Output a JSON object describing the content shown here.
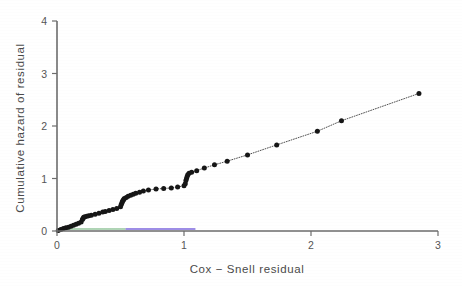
{
  "chart_data": {
    "type": "scatter",
    "title": "",
    "xlabel": "Cox − Snell residual",
    "ylabel": "Cumulative hazard of residual",
    "xlim": [
      0,
      3
    ],
    "ylim": [
      0,
      4
    ],
    "xticks": [
      0,
      1,
      2,
      3
    ],
    "xtick_labels": [
      "0",
      "1",
      "2",
      "3"
    ],
    "yticks": [
      0,
      1,
      2,
      3,
      4
    ],
    "ytick_labels": [
      "0",
      "1",
      "2",
      "3",
      "4"
    ],
    "grid": false,
    "legend": "none",
    "marker": "filled-circle",
    "line_style": "dotted",
    "series": [
      {
        "name": "Cumulative hazard of Cox-Snell residual",
        "x": [
          0.01,
          0.03,
          0.05,
          0.07,
          0.09,
          0.11,
          0.13,
          0.15,
          0.17,
          0.19,
          0.2,
          0.205,
          0.21,
          0.22,
          0.235,
          0.25,
          0.27,
          0.3,
          0.33,
          0.36,
          0.38,
          0.41,
          0.44,
          0.47,
          0.5,
          0.505,
          0.51,
          0.515,
          0.52,
          0.525,
          0.53,
          0.545,
          0.56,
          0.58,
          0.6,
          0.62,
          0.65,
          0.68,
          0.72,
          0.78,
          0.84,
          0.9,
          0.95,
          1.0,
          1.01,
          1.015,
          1.02,
          1.025,
          1.03,
          1.04,
          1.06,
          1.1,
          1.16,
          1.24,
          1.34,
          1.5,
          1.73,
          2.05,
          2.24,
          2.85
        ],
        "y": [
          0.01,
          0.03,
          0.05,
          0.06,
          0.07,
          0.09,
          0.11,
          0.13,
          0.15,
          0.17,
          0.22,
          0.24,
          0.26,
          0.27,
          0.28,
          0.29,
          0.3,
          0.32,
          0.34,
          0.36,
          0.37,
          0.39,
          0.41,
          0.43,
          0.46,
          0.5,
          0.53,
          0.56,
          0.58,
          0.6,
          0.62,
          0.64,
          0.66,
          0.68,
          0.7,
          0.72,
          0.74,
          0.76,
          0.78,
          0.8,
          0.81,
          0.82,
          0.84,
          0.86,
          0.9,
          0.96,
          1.0,
          1.04,
          1.07,
          1.1,
          1.12,
          1.15,
          1.2,
          1.26,
          1.33,
          1.45,
          1.64,
          1.9,
          2.1,
          2.62
        ],
        "color": "#161616"
      }
    ],
    "reference_lines": [
      {
        "name": "lower-green-reference",
        "color": "#3f9a4e",
        "x": [
          0.0,
          0.54
        ],
        "y": [
          0.0,
          0.0
        ]
      },
      {
        "name": "lower-blue-reference",
        "color": "#5a3fd6",
        "x": [
          0.54,
          1.09
        ],
        "y": [
          0.0,
          0.0
        ]
      }
    ]
  },
  "figure": {
    "background_color": "#ffffff",
    "axis_color": "#6d6d6d",
    "point_color": "#161616"
  }
}
